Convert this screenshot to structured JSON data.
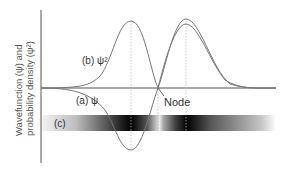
{
  "figure": {
    "y_axis_label_line1": "Wavefunction (ψ) and",
    "y_axis_label_line2": "probability density (ψ²)",
    "label_b": "(b) ψ²",
    "label_a": "(a)   ψ",
    "label_c": "(c)",
    "node_label": "Node"
  },
  "colors": {
    "curve": "#777777",
    "axis": "#555555",
    "guide": "#bbbbbb",
    "band_dark": "#000000",
    "band_light": "#ffffff"
  }
}
